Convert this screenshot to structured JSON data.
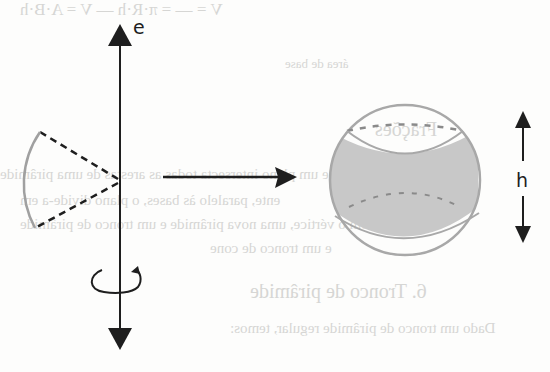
{
  "diagram": {
    "axis_label": "e",
    "height_label": "h",
    "elements": {
      "rotation_axis": "vertical axis e with arrows at both ends",
      "generating_figure": "circular sector with dashed radii and arc",
      "rotation_indicator": "curved arrow around axis",
      "transformation_arrow": "horizontal arrow pointing to solid",
      "resulting_solid": "sphere with shaded spherical zone between two dashed parallel circles",
      "height_indicator": "double-headed vertical arrow labelled h"
    },
    "colors": {
      "ink": "#1e1e1e",
      "sphere_outline": "#a8a8a8",
      "zone_fill": "#c8c8c8",
      "sector_arc": "#a0a0a0"
    }
  },
  "background_bleed": {
    "line1": "V = — = π·R·h — V   =   A·B·h",
    "line2": "área de base",
    "line3": "Frações",
    "line4": "Se um plano intersecta todas as arestas de uma pirâmide",
    "line5": "ente, paralelo às bases, o plano divide-a em",
    "line6": "em com o vértice, uma nova pirâmide e um tronco de pirâmide",
    "line7": "e um tronco de cone",
    "line8": "6. Tronco de pirâmide",
    "line9": "Dado um tronco de pirâmide regular, temos:"
  }
}
